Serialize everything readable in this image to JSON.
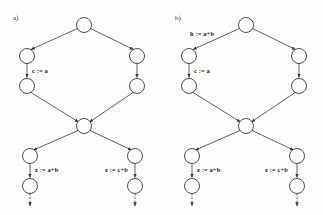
{
  "figure": {
    "type": "control-flow-graph-pair",
    "background_color": "#fdfdfc",
    "node_stroke_color": "#3a3a3a",
    "edge_stroke_color": "#3a3a3a",
    "text_color": "#1d1d1d"
  },
  "panels": [
    {
      "id": "a",
      "label": "a)",
      "edge_labels": {
        "top_left_edge": "",
        "left_upper_chain": "c := a",
        "bottom_left_chain": "z := a+b",
        "bottom_right_chain": "z := c+b"
      }
    },
    {
      "id": "b",
      "label": "b)",
      "edge_labels": {
        "top_left_edge": "h := a+b",
        "left_upper_chain": "c := a",
        "bottom_left_chain": "z := a+b",
        "bottom_right_chain": "z := c+b"
      }
    }
  ],
  "graph_structure": {
    "nodes": [
      {
        "name": "entry",
        "cx": 84,
        "cy": 25,
        "r": 7.5
      },
      {
        "name": "left-upper",
        "cx": 27,
        "cy": 56,
        "r": 7.5
      },
      {
        "name": "left-lower",
        "cx": 27,
        "cy": 86,
        "r": 7.5
      },
      {
        "name": "right-upper",
        "cx": 137,
        "cy": 56,
        "r": 7.5
      },
      {
        "name": "right-lower",
        "cx": 137,
        "cy": 86,
        "r": 7.5
      },
      {
        "name": "junction",
        "cx": 84,
        "cy": 126,
        "r": 7.5
      },
      {
        "name": "exit-left-upper",
        "cx": 30,
        "cy": 156,
        "r": 7.5
      },
      {
        "name": "exit-left-lower",
        "cx": 30,
        "cy": 186,
        "r": 7.5
      },
      {
        "name": "exit-right-upper",
        "cx": 135,
        "cy": 156,
        "r": 7.5
      },
      {
        "name": "exit-right-lower",
        "cx": 135,
        "cy": 186,
        "r": 7.5
      }
    ],
    "edges": [
      {
        "name": "entry-to-left-upper",
        "from": "entry",
        "to": "left-upper",
        "style": "solid",
        "arrow": true
      },
      {
        "name": "entry-to-right-upper",
        "from": "entry",
        "to": "right-upper",
        "style": "solid",
        "arrow": true
      },
      {
        "name": "left-upper-to-left-lower",
        "from": "left-upper",
        "to": "left-lower",
        "style": "solid",
        "arrow": true
      },
      {
        "name": "right-upper-to-right-lower",
        "from": "right-upper",
        "to": "right-lower",
        "style": "solid",
        "arrow": true
      },
      {
        "name": "left-lower-to-junction",
        "from": "left-lower",
        "to": "junction",
        "style": "solid",
        "arrow": true
      },
      {
        "name": "right-lower-to-junction",
        "from": "right-lower",
        "to": "junction",
        "style": "solid",
        "arrow": true
      },
      {
        "name": "junction-to-exit-left",
        "from": "junction",
        "to": "exit-left-upper",
        "style": "solid",
        "arrow": true
      },
      {
        "name": "junction-to-exit-right",
        "from": "junction",
        "to": "exit-right-upper",
        "style": "solid",
        "arrow": true
      },
      {
        "name": "exit-left-chain",
        "from": "exit-left-upper",
        "to": "exit-left-lower",
        "style": "solid",
        "arrow": true
      },
      {
        "name": "exit-right-chain",
        "from": "exit-right-upper",
        "to": "exit-right-lower",
        "style": "solid",
        "arrow": true
      },
      {
        "name": "exit-left-tail",
        "from": "exit-left-lower",
        "to": "below",
        "style": "dashed",
        "arrow": true
      },
      {
        "name": "exit-right-tail",
        "from": "exit-right-lower",
        "to": "below",
        "style": "dashed",
        "arrow": true
      }
    ]
  }
}
